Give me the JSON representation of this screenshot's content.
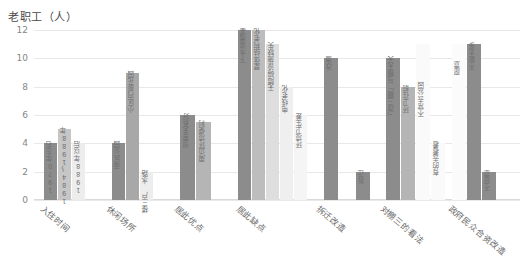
{
  "chart_data": {
    "type": "bar",
    "title": "老职工（人）",
    "xlabel": "",
    "ylabel": "",
    "ylim": [
      0,
      12
    ],
    "yticks": [
      "0",
      "2",
      "4",
      "6",
      "8",
      "10",
      "12"
    ],
    "grid": true,
    "legend": "none",
    "categories": [
      "入住时间",
      "休闲场所",
      "居此优点",
      "居此缺点",
      "拆迁改造",
      "对棚三的看法",
      "政府民众合资改造"
    ],
    "groups": [
      {
        "category": "入住时间",
        "bars": [
          {
            "label": "1970年左右",
            "value": 4,
            "color": "#8c8c8c"
          },
          {
            "label": "1984～1988年",
            "value": 5,
            "color": "#c6c6c6"
          },
          {
            "label": "1988年以后",
            "value": 4,
            "color": "#ededed"
          }
        ]
      },
      {
        "category": "休闲场所",
        "bars": [
          {
            "label": "南民公园",
            "value": 4,
            "color": "#8c8c8c"
          },
          {
            "label": "小区内部花园",
            "value": 9,
            "color": "#a8a8a8"
          },
          {
            "label": "楼三户 水路",
            "value": 2,
            "color": "#ededed"
          }
        ]
      },
      {
        "category": "居此优点",
        "bars": [
          {
            "label": "邻里关系好",
            "value": 6,
            "color": "#8c8c8c"
          },
          {
            "label": "周边环境便利",
            "value": 5.5,
            "color": "#b5b5b5"
          }
        ]
      },
      {
        "category": "居此缺点",
        "bars": [
          {
            "label": "下水道堵塞",
            "value": 12,
            "color": "#8c8c8c"
          },
          {
            "label": "屋体结构老化",
            "value": 12,
            "color": "#bdbdbd"
          },
          {
            "label": "无障碍设施缺失",
            "value": 11,
            "color": "#dedede"
          },
          {
            "label": "电线老化",
            "value": 8,
            "color": "#efefef"
          },
          {
            "label": "环境卫生差",
            "value": 6,
            "color": "#f5f5f5"
          }
        ]
      },
      {
        "category": "拆迁改造",
        "bars": [
          {
            "label": "改造",
            "value": 10,
            "color": "#8c8c8c"
          },
          {
            "label": "拆迁",
            "value": 2,
            "color": "#8c8c8c"
          }
        ]
      },
      {
        "category": "对棚三的看法",
        "bars": [
          {
            "label": "「改三棚」与棚天天",
            "value": 10,
            "color": "#8c8c8c"
          },
          {
            "label": "环卫往前",
            "value": 8,
            "color": "#b5b5b5"
          },
          {
            "label": "不常去公园",
            "value": 11,
            "color": "#fafafa"
          },
          {
            "label": "有的去看看",
            "value": 4,
            "color": "#fafafa"
          }
        ]
      },
      {
        "category": "政府民众合资改造",
        "bars": [
          {
            "label": "愿意",
            "value": 11,
            "color": "#fbfbfb"
          },
          {
            "label": "不能太多",
            "value": 11,
            "color": "#8c8c8c"
          },
          {
            "label": "不愿意",
            "value": 2,
            "color": "#8c8c8c"
          }
        ]
      }
    ]
  },
  "colors": {
    "grid": "#e8e8e8",
    "text": "#6b6b6b",
    "bar_dark": "#8c8c8c",
    "bar_mid": "#bdbdbd",
    "bar_light": "#ededed"
  }
}
